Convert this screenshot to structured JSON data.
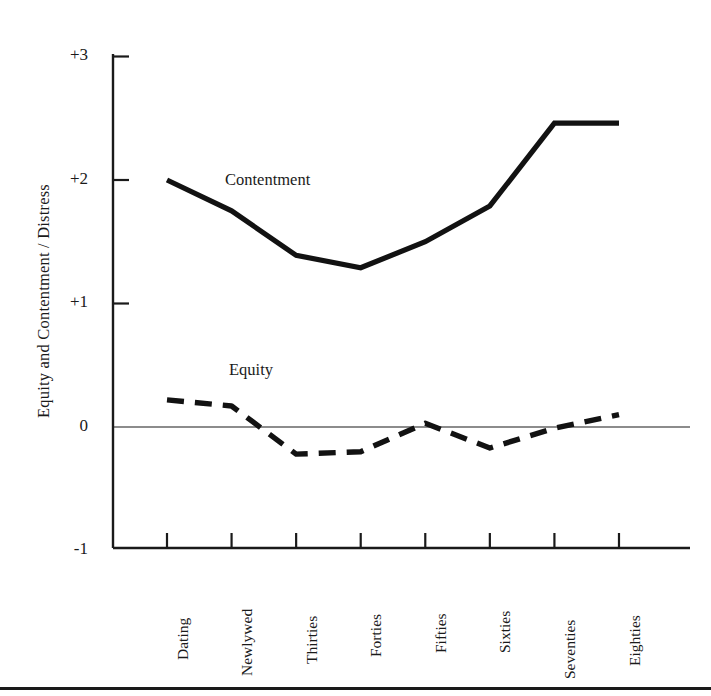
{
  "chart_data": {
    "type": "line",
    "title": "",
    "subtitle": "",
    "xlabel": "",
    "ylabel": "Equity and Contentment / Distress",
    "categories": [
      "Dating",
      "Newlywed",
      "Thirties",
      "Forties",
      "Fifties",
      "Sixties",
      "Seventies",
      "Eighties"
    ],
    "ylim": [
      -1,
      3
    ],
    "yticks": [
      3,
      2,
      1,
      0,
      -1
    ],
    "ytick_labels": [
      "+3",
      "+2",
      "+1",
      "0",
      "-1"
    ],
    "grid": false,
    "zero_line": true,
    "legend_position": "inline-annotations",
    "series": [
      {
        "name": "Contentment",
        "style": "solid",
        "color": "#121212",
        "line_width": 5,
        "annotation": "Contentment",
        "values": [
          2.0,
          1.75,
          1.39,
          1.29,
          1.5,
          1.79,
          2.46,
          2.46
        ]
      },
      {
        "name": "Equity",
        "style": "dashed",
        "color": "#121212",
        "line_width": 5,
        "annotation": "Equity",
        "values": [
          0.22,
          0.17,
          -0.22,
          -0.2,
          0.03,
          -0.17,
          -0.01,
          0.1
        ]
      }
    ]
  },
  "axes": {
    "y_title": "Equity and Contentment / Distress",
    "y_tick_labels": [
      "+3",
      "+2",
      "+1",
      "0",
      "-1"
    ],
    "x_tick_labels": [
      "Dating",
      "Newlywed",
      "Thirties",
      "Forties",
      "Fifties",
      "Sixties",
      "Seventies",
      "Eighties"
    ]
  },
  "annotations": {
    "contentment": "Contentment",
    "equity": "Equity"
  },
  "colors": {
    "ink": "#121212",
    "axis": "#1a1a1a",
    "background": "#ffffff"
  }
}
